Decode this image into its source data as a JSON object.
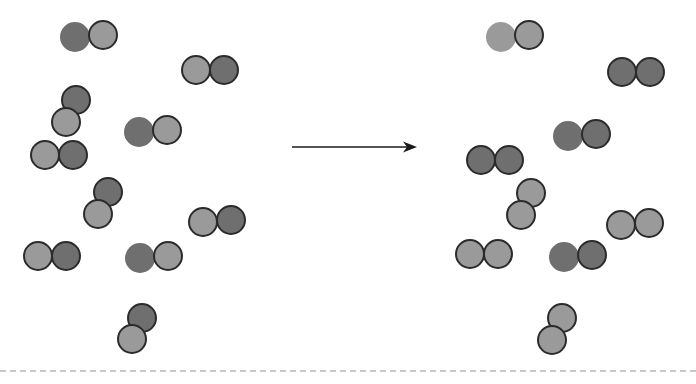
{
  "figure": {
    "type": "particle-diagram",
    "background_color": "#ffffff",
    "width": 696,
    "height": 384,
    "atom_radius": 15,
    "colors": {
      "light_atom": "#9a9a9a",
      "dark_atom": "#6f6f6f",
      "outline": "#2b2b2b",
      "arrow": "#1a1a1a",
      "baseline": "#c9c9c9"
    },
    "arrow": {
      "name": "reaction-arrow",
      "direction": "right",
      "x_start": 292,
      "x_end": 415,
      "y": 147
    },
    "baseline": {
      "name": "dashed-baseline",
      "style": "dashed",
      "y": 370
    }
  },
  "reactants": {
    "label": "",
    "molecule_count": 8,
    "molecules": [
      {
        "name": "molecule-r1",
        "composition": "dark-light",
        "atoms": [
          {
            "x": 75,
            "y": 37,
            "shade": "dark",
            "outlined": false
          },
          {
            "x": 103,
            "y": 35,
            "shade": "light",
            "outlined": true
          }
        ]
      },
      {
        "name": "molecule-r2",
        "composition": "light-dark",
        "atoms": [
          {
            "x": 196,
            "y": 70,
            "shade": "light",
            "outlined": true
          },
          {
            "x": 224,
            "y": 70,
            "shade": "dark",
            "outlined": true
          }
        ]
      },
      {
        "name": "molecule-r3",
        "composition": "dark-light",
        "atoms": [
          {
            "x": 76,
            "y": 100,
            "shade": "dark",
            "outlined": true
          },
          {
            "x": 66,
            "y": 122,
            "shade": "light",
            "outlined": true
          }
        ]
      },
      {
        "name": "molecule-r4",
        "composition": "dark-light",
        "atoms": [
          {
            "x": 139,
            "y": 132,
            "shade": "dark",
            "outlined": false
          },
          {
            "x": 167,
            "y": 130,
            "shade": "light",
            "outlined": true
          }
        ]
      },
      {
        "name": "molecule-r5",
        "composition": "light-dark",
        "atoms": [
          {
            "x": 45,
            "y": 155,
            "shade": "light",
            "outlined": true
          },
          {
            "x": 73,
            "y": 155,
            "shade": "dark",
            "outlined": true
          }
        ]
      },
      {
        "name": "molecule-r6",
        "composition": "dark-light",
        "atoms": [
          {
            "x": 108,
            "y": 192,
            "shade": "dark",
            "outlined": true
          },
          {
            "x": 98,
            "y": 214,
            "shade": "light",
            "outlined": true
          }
        ]
      },
      {
        "name": "molecule-r7",
        "composition": "light-dark",
        "atoms": [
          {
            "x": 203,
            "y": 222,
            "shade": "light",
            "outlined": true
          },
          {
            "x": 231,
            "y": 220,
            "shade": "dark",
            "outlined": true
          }
        ]
      },
      {
        "name": "molecule-r8",
        "composition": "light-dark",
        "atoms": [
          {
            "x": 38,
            "y": 256,
            "shade": "light",
            "outlined": true
          },
          {
            "x": 66,
            "y": 256,
            "shade": "dark",
            "outlined": true
          }
        ]
      },
      {
        "name": "molecule-r9",
        "composition": "dark-light",
        "atoms": [
          {
            "x": 140,
            "y": 258,
            "shade": "dark",
            "outlined": false
          },
          {
            "x": 168,
            "y": 256,
            "shade": "light",
            "outlined": true
          }
        ]
      },
      {
        "name": "molecule-r10",
        "composition": "dark-light",
        "atoms": [
          {
            "x": 142,
            "y": 318,
            "shade": "dark",
            "outlined": true
          },
          {
            "x": 132,
            "y": 339,
            "shade": "light",
            "outlined": true
          }
        ]
      }
    ]
  },
  "products": {
    "label": "",
    "molecule_count": 8,
    "molecules": [
      {
        "name": "molecule-p1",
        "composition": "light-light",
        "atoms": [
          {
            "x": 501,
            "y": 37,
            "shade": "light",
            "outlined": false
          },
          {
            "x": 529,
            "y": 35,
            "shade": "light",
            "outlined": true
          }
        ]
      },
      {
        "name": "molecule-p2",
        "composition": "dark-dark",
        "atoms": [
          {
            "x": 622,
            "y": 72,
            "shade": "dark",
            "outlined": true
          },
          {
            "x": 650,
            "y": 72,
            "shade": "dark",
            "outlined": true
          }
        ]
      },
      {
        "name": "molecule-p3",
        "composition": "dark-dark",
        "atoms": [
          {
            "x": 568,
            "y": 136,
            "shade": "dark",
            "outlined": false
          },
          {
            "x": 596,
            "y": 134,
            "shade": "dark",
            "outlined": true
          }
        ]
      },
      {
        "name": "molecule-p4",
        "composition": "dark-dark",
        "atoms": [
          {
            "x": 481,
            "y": 160,
            "shade": "dark",
            "outlined": true
          },
          {
            "x": 509,
            "y": 160,
            "shade": "dark",
            "outlined": true
          }
        ]
      },
      {
        "name": "molecule-p5",
        "composition": "light-light",
        "atoms": [
          {
            "x": 531,
            "y": 193,
            "shade": "light",
            "outlined": true
          },
          {
            "x": 521,
            "y": 215,
            "shade": "light",
            "outlined": true
          }
        ]
      },
      {
        "name": "molecule-p6",
        "composition": "light-light",
        "atoms": [
          {
            "x": 621,
            "y": 225,
            "shade": "light",
            "outlined": true
          },
          {
            "x": 649,
            "y": 223,
            "shade": "light",
            "outlined": true
          }
        ]
      },
      {
        "name": "molecule-p7",
        "composition": "light-light",
        "atoms": [
          {
            "x": 470,
            "y": 254,
            "shade": "light",
            "outlined": true
          },
          {
            "x": 498,
            "y": 254,
            "shade": "light",
            "outlined": true
          }
        ]
      },
      {
        "name": "molecule-p8",
        "composition": "dark-dark",
        "atoms": [
          {
            "x": 564,
            "y": 257,
            "shade": "dark",
            "outlined": false
          },
          {
            "x": 592,
            "y": 255,
            "shade": "dark",
            "outlined": true
          }
        ]
      },
      {
        "name": "molecule-p9",
        "composition": "light-light",
        "atoms": [
          {
            "x": 562,
            "y": 318,
            "shade": "light",
            "outlined": true
          },
          {
            "x": 552,
            "y": 340,
            "shade": "light",
            "outlined": true
          }
        ]
      }
    ]
  }
}
